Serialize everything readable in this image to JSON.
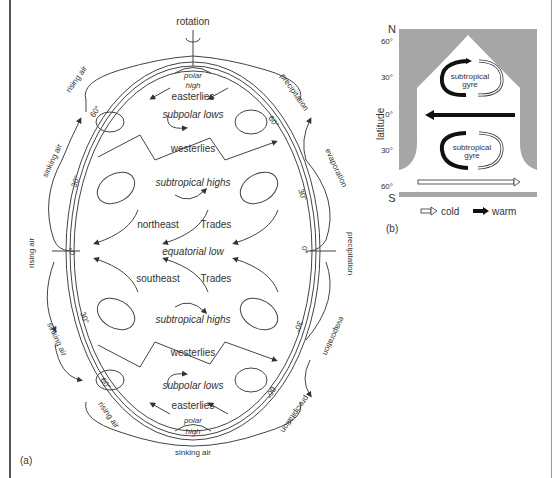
{
  "panel_a": {
    "label": "(a)",
    "top_label": "rotation",
    "bottom_label": "sinking air",
    "polar_high_top": {
      "line1": "polar",
      "line2": "high"
    },
    "polar_high_bottom": {
      "line1": "polar",
      "line2": "high"
    },
    "zones": {
      "easterlies_n": "easterlies",
      "subpolar_lows_n": "subpolar lows",
      "westerlies_n": "westerlies",
      "subtropical_highs_n": "subtropical highs",
      "northeast": "northeast",
      "trades_n": "Trades",
      "equatorial_low": "equatorial low",
      "southeast": "southeast",
      "trades_s": "Trades",
      "subtropical_highs_s": "subtropical highs",
      "westerlies_s": "westerlies",
      "subpolar_lows_s": "subpolar lows",
      "easterlies_s": "easterlies"
    },
    "left_labels": {
      "rising_air_n": "rising air",
      "sinking_air_n": "sinking air",
      "rising_air_eq": "rising air",
      "sinking_air_s": "sinking air",
      "rising_air_s": "rising air"
    },
    "right_labels": {
      "precipitation_n": "precipitation",
      "evaporation_n": "evaporation",
      "precipitation_eq": "precipitation",
      "evaporation_s": "evaporation",
      "precipitation_s": "precipitation"
    },
    "latitudes": {
      "l60n": "60°",
      "l30n": "30°",
      "l0": "0°",
      "l30s": "30°",
      "l60s": "60°",
      "r60n": "60°",
      "r30n": "30°",
      "r0": "0°",
      "r30s": "30°",
      "r60s": "60°"
    }
  },
  "panel_b": {
    "label": "(b)",
    "axis_label": "latitude",
    "north": "N",
    "south": "S",
    "ticks": [
      "60°",
      "30°",
      "0°",
      "30°",
      "60°"
    ],
    "gyre_n": {
      "line1": "subtropical",
      "line2": "gyre"
    },
    "gyre_s": {
      "line1": "subtropical",
      "line2": "gyre"
    },
    "legend": {
      "cold": "cold",
      "warm": "warm"
    },
    "colors": {
      "land": "#a6a6a6",
      "warm": "#111111",
      "cold": "#ffffff"
    }
  }
}
